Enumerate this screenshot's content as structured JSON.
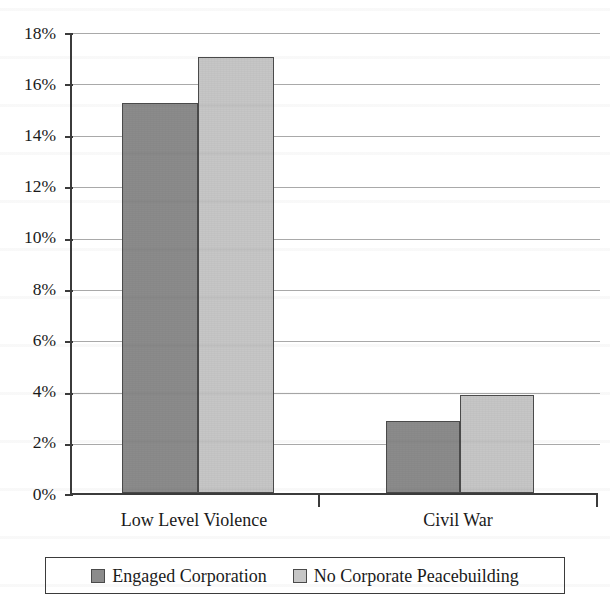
{
  "chart_data": {
    "type": "bar",
    "title": "",
    "subtitle": "",
    "xlabel": "",
    "ylabel": "",
    "categories": [
      "Low Level Violence",
      "Civil War"
    ],
    "series": [
      {
        "name": "Engaged Corporation",
        "color": "#8b8b8b",
        "values": [
          15.2,
          2.8
        ]
      },
      {
        "name": "No Corporate Peacebuilding",
        "color": "#c6c6c6",
        "values": [
          17.0,
          3.8
        ]
      }
    ],
    "ylim": [
      0,
      18
    ],
    "ytick_step": 2,
    "ytick_labels": [
      "0%",
      "2%",
      "4%",
      "6%",
      "8%",
      "10%",
      "12%",
      "14%",
      "16%",
      "18%"
    ],
    "value_format": "percent",
    "grid": true,
    "grid_axis": "y",
    "legend": true,
    "legend_position": "bottom",
    "legend_border": true
  },
  "axis": {
    "y_ticks": [
      {
        "label": "18%",
        "value": 18
      },
      {
        "label": "16%",
        "value": 16
      },
      {
        "label": "14%",
        "value": 14
      },
      {
        "label": "12%",
        "value": 12
      },
      {
        "label": "10%",
        "value": 10
      },
      {
        "label": "8%",
        "value": 8
      },
      {
        "label": "6%",
        "value": 6
      },
      {
        "label": "4%",
        "value": 4
      },
      {
        "label": "2%",
        "value": 2
      },
      {
        "label": "0%",
        "value": 0
      }
    ],
    "x_categories": [
      {
        "label": "Low Level Violence"
      },
      {
        "label": "Civil War"
      }
    ]
  },
  "legend": {
    "entries": [
      {
        "label": "Engaged Corporation",
        "color": "#8b8b8b"
      },
      {
        "label": "No Corporate Peacebuilding",
        "color": "#c6c6c6"
      }
    ]
  },
  "colors": {
    "series_dark": "#8b8b8b",
    "series_light": "#c6c6c6",
    "axis": "#3b3b3b",
    "gridline": "#a9a9a9",
    "bar_outline": "#4a4a4a",
    "background": "#ffffff"
  },
  "bars": [
    {
      "category": "Low Level Violence",
      "series": "Engaged Corporation",
      "value": 15.2,
      "label": "15.2%"
    },
    {
      "category": "Low Level Violence",
      "series": "No Corporate Peacebuilding",
      "value": 17.0,
      "label": "17.0%"
    },
    {
      "category": "Civil War",
      "series": "Engaged Corporation",
      "value": 2.8,
      "label": "2.8%"
    },
    {
      "category": "Civil War",
      "series": "No Corporate Peacebuilding",
      "value": 3.8,
      "label": "3.8%"
    }
  ]
}
